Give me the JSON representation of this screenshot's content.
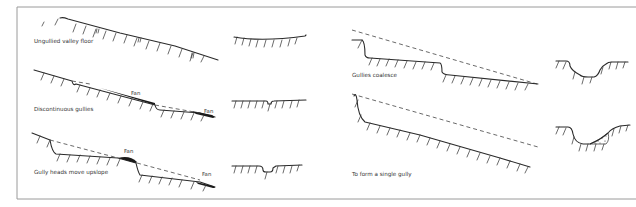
{
  "figure": {
    "panels_left": [
      {
        "id": "stage-1",
        "caption": "Ungullied valley floor",
        "fan_labels": []
      },
      {
        "id": "stage-2",
        "caption": "Discontinuous gullies",
        "fan_labels": [
          "Fan",
          "Fan"
        ]
      },
      {
        "id": "stage-3",
        "caption": "Gully heads move upslope",
        "fan_labels": [
          "Fan",
          "Fan"
        ]
      }
    ],
    "panels_right": [
      {
        "id": "stage-4",
        "caption": "Gullies coalesce"
      },
      {
        "id": "stage-5",
        "caption": "To form a single gully"
      }
    ],
    "colors": {
      "line": "#2a2a2a",
      "frame": "#9a9a9a",
      "background": "#ffffff"
    }
  }
}
